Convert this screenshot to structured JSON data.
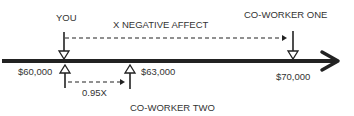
{
  "labels": {
    "you": "YOU",
    "negative_affect": "X NEGATIVE AFFECT",
    "coworker_one": "CO-WORKER ONE",
    "coworker_two": "CO-WORKER TWO",
    "salary_you": "$60,000",
    "salary_coworker_two": "$63,000",
    "salary_coworker_one": "$70,000",
    "ratio": "0.95X"
  },
  "colors": {
    "line": "#222222",
    "text": "#333333"
  }
}
